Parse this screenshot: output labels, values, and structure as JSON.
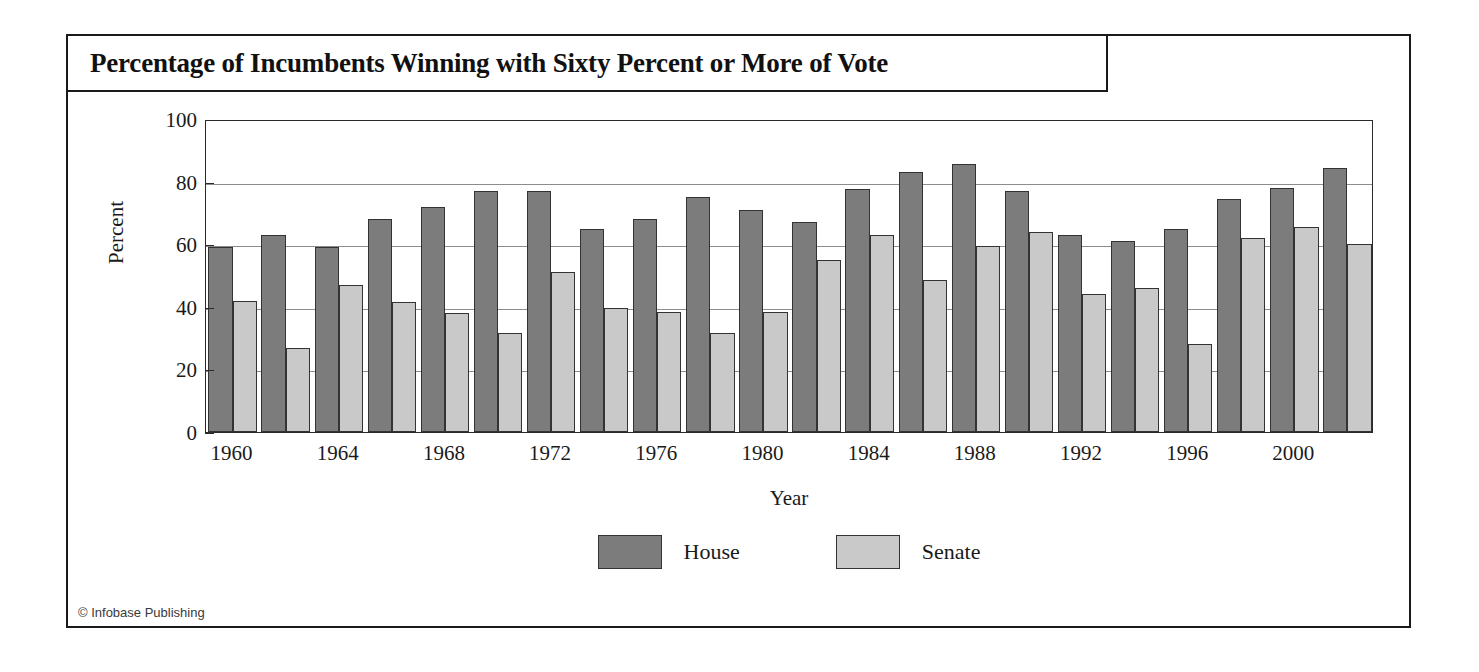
{
  "figure": {
    "title": "Percentage of Incumbents Winning with Sixty Percent or More of Vote",
    "credit": "© Infobase Publishing"
  },
  "chart_data": {
    "type": "bar",
    "title": "Percentage of Incumbents Winning with Sixty Percent or More of Vote",
    "xlabel": "Year",
    "ylabel": "Percent",
    "ylim": [
      0,
      100
    ],
    "yticks": [
      0,
      20,
      40,
      60,
      80,
      100
    ],
    "grid": true,
    "legend_position": "bottom-center",
    "categories": [
      "1960",
      "1962",
      "1964",
      "1966",
      "1968",
      "1970",
      "1972",
      "1974",
      "1976",
      "1978",
      "1980",
      "1982",
      "1984",
      "1986",
      "1988",
      "1990",
      "1992",
      "1994",
      "1996",
      "1998",
      "2000",
      "2002"
    ],
    "xtick_labels": [
      "1960",
      "1964",
      "1968",
      "1972",
      "1976",
      "1980",
      "1984",
      "1988",
      "1992",
      "1996",
      "2000"
    ],
    "series": [
      {
        "name": "House",
        "color": "#7c7c7c",
        "values": [
          59,
          63,
          59,
          68,
          72,
          77,
          77,
          65,
          68,
          75,
          71,
          67,
          77.5,
          83,
          85.5,
          77,
          63,
          61,
          65,
          74.5,
          78,
          84.5
        ]
      },
      {
        "name": "Senate",
        "color": "#c9c9c9",
        "values": [
          42,
          27,
          47,
          41.5,
          38,
          31.5,
          51,
          39.5,
          38.5,
          31.5,
          38.5,
          55,
          63,
          48.5,
          59.5,
          64,
          44,
          46,
          28,
          62,
          65.5,
          60
        ]
      }
    ]
  }
}
